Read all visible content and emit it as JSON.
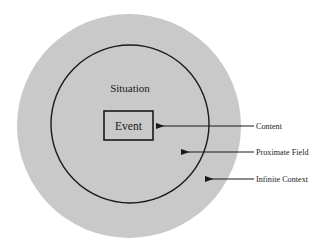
{
  "diagram": {
    "type": "concentric-circles",
    "title": "",
    "background_color": "#ffffff",
    "shapes": {
      "outer_circle": {
        "name": "Infinite Context region",
        "fill": "#c9c9c9",
        "stroke": "none",
        "cx": 129,
        "cy": 126,
        "r": 112
      },
      "inner_circle": {
        "name": "Situation region",
        "fill": "#c9c9c9",
        "stroke": "#1a1a1a",
        "stroke_width": 1.4,
        "cx": 130,
        "cy": 124,
        "r": 79
      },
      "event_box": {
        "name": "Event box",
        "fill": "#c9c9c9",
        "stroke": "#1a1a1a",
        "stroke_width": 1.6,
        "x": 104,
        "y": 111,
        "width": 49,
        "height": 29
      }
    },
    "labels": {
      "situation": "Situation",
      "event": "Event"
    },
    "callouts": [
      {
        "id": "content",
        "label": "Content",
        "target": "Event box",
        "arrow": {
          "x1": 254,
          "y1": 126,
          "x2": 156,
          "y2": 126
        },
        "text_x": 256,
        "text_y": 129
      },
      {
        "id": "proximate-field",
        "label": "Proximate Field",
        "target": "Situation circle",
        "arrow": {
          "x1": 254,
          "y1": 152,
          "x2": 181,
          "y2": 152
        },
        "text_x": 256,
        "text_y": 155
      },
      {
        "id": "infinite-context",
        "label": "Infinite Context",
        "target": "Outer circle",
        "arrow": {
          "x1": 254,
          "y1": 179,
          "x2": 205,
          "y2": 179
        },
        "text_x": 256,
        "text_y": 182
      }
    ],
    "colors": {
      "fill_gray": "#c9c9c9",
      "line_dark": "#1a1a1a",
      "background": "#ffffff"
    }
  }
}
